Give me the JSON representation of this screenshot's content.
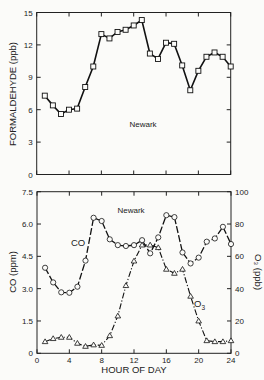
{
  "chart_data": [
    {
      "type": "line",
      "title": "Newark",
      "xlabel": "",
      "ylabel": "FORMALDEHYDE (ppb)",
      "xlim": [
        0,
        24
      ],
      "ylim": [
        0,
        15
      ],
      "yticks": [
        "0",
        "3",
        "6",
        "9",
        "12",
        "15"
      ],
      "xticks": [
        0,
        4,
        8,
        12,
        16,
        20,
        24
      ],
      "grid": false,
      "marker": "square",
      "x": [
        1,
        2,
        3,
        4,
        5,
        6,
        7,
        8,
        9,
        10,
        11,
        12,
        13,
        14,
        15,
        16,
        17,
        18,
        19,
        20,
        21,
        22,
        23,
        24
      ],
      "series": [
        {
          "name": "Formaldehyde",
          "values": [
            7.3,
            6.4,
            5.6,
            6.0,
            6.1,
            8.1,
            10.0,
            13.0,
            12.6,
            13.2,
            13.4,
            13.8,
            14.3,
            11.2,
            10.7,
            12.2,
            12.1,
            10.1,
            7.8,
            9.6,
            10.9,
            11.3,
            10.9,
            10.0
          ]
        }
      ]
    },
    {
      "type": "line",
      "title": "Newark",
      "xlabel": "HOUR OF DAY",
      "ylabel": "CO (ppm)",
      "ylabel_right": "O3 (ppb)",
      "xlim": [
        0,
        24
      ],
      "ylim": [
        0,
        7.5
      ],
      "ylim_right": [
        0,
        100
      ],
      "xticks": [
        "0",
        "4",
        "8",
        "12",
        "16",
        "20",
        "24"
      ],
      "yticks": [
        "0",
        "1.5",
        "3.0",
        "4.5",
        "6.0",
        "7.5"
      ],
      "yticks_right": [
        "0",
        "20",
        "40",
        "60",
        "80",
        "100"
      ],
      "grid": false,
      "x": [
        1,
        2,
        3,
        4,
        5,
        6,
        7,
        8,
        9,
        10,
        11,
        12,
        13,
        14,
        15,
        16,
        17,
        18,
        19,
        20,
        21,
        22,
        23,
        24
      ],
      "series": [
        {
          "name": "CO",
          "axis": "left",
          "marker": "circle",
          "linestyle": "dashed",
          "values": [
            3.97,
            3.29,
            2.83,
            2.81,
            3.09,
            4.3,
            6.29,
            6.14,
            5.29,
            5.02,
            4.98,
            5.02,
            5.25,
            4.64,
            5.38,
            6.41,
            6.32,
            4.68,
            4.17,
            4.44,
            5.18,
            5.33,
            5.87,
            5.07
          ]
        },
        {
          "name": "O3",
          "axis": "right",
          "marker": "triangle",
          "linestyle": "dash-dot",
          "values": [
            7.2,
            9.1,
            9.9,
            9.9,
            6.2,
            4.3,
            5.2,
            4.9,
            10.9,
            23.1,
            41.9,
            57.1,
            67.0,
            67.0,
            65.4,
            52.0,
            49.5,
            52.0,
            35.3,
            20.0,
            7.8,
            7.2,
            7.2,
            7.8
          ]
        }
      ],
      "annotations": [
        {
          "text": "CO",
          "near_hour": 5.5
        },
        {
          "text": "O3",
          "near_hour": 19.5
        }
      ]
    }
  ],
  "labels": {
    "top_ylabel": "FORMALDEHYDE (ppb)",
    "top_title": "Newark",
    "bottom_ylabel_left": "CO (ppm)",
    "bottom_ylabel_right": "O₃ (ppb)",
    "bottom_title": "Newark",
    "xlabel": "HOUR OF DAY",
    "co_label": "CO",
    "o3_label": "O",
    "o3_sub": "3"
  }
}
